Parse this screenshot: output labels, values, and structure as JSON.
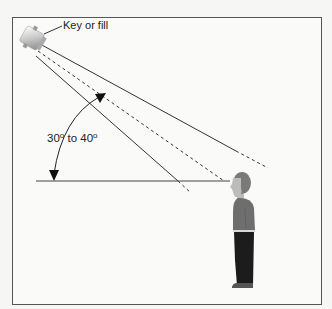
{
  "diagram": {
    "light_label": "Key or fill",
    "angle_label": {
      "from": "30",
      "to_word": "to",
      "to": "40",
      "degree_symbol": "o"
    },
    "elements": {
      "light": "spotlight (key or fill)",
      "subject": "standing person",
      "horizontal_reference": "eye-level line"
    },
    "colors": {
      "background": "#f6f6f4",
      "frame": "#555555",
      "lines": "#333333",
      "head": "#7a7a7a",
      "face": "#b8b8b8",
      "shirt": "#6e6e6e",
      "pants": "#1c1c1c",
      "shoes": "#555555"
    }
  }
}
